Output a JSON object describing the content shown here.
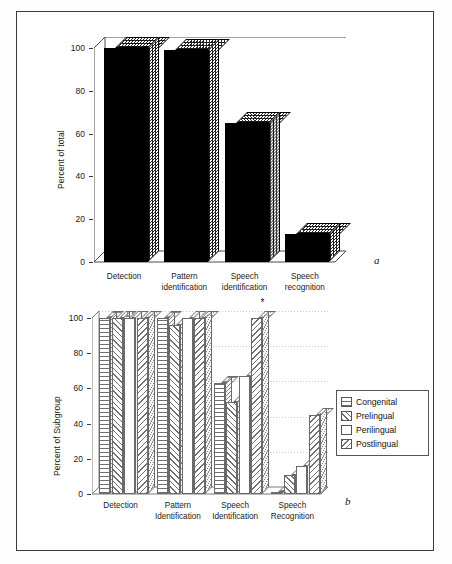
{
  "figure": {
    "panel_a_label": "a",
    "panel_b_label": "b",
    "significance_marker": "*"
  },
  "chart_data": [
    {
      "type": "bar",
      "panel": "a",
      "title": "",
      "xlabel": "",
      "ylabel": "Percent of total",
      "ylim": [
        0,
        100
      ],
      "yticks": [
        0,
        20,
        40,
        60,
        80,
        100
      ],
      "ytick_labels": [
        "0",
        "20",
        "40",
        "60",
        "80",
        "100"
      ],
      "grid": false,
      "legend": "none",
      "style": "3d-solid-black",
      "categories": [
        "Detection",
        "Pattern identification",
        "Speech identification",
        "Speech recognition"
      ],
      "category_lines": [
        [
          "Detection"
        ],
        [
          "Pattern",
          "identification"
        ],
        [
          "Speech",
          "identification"
        ],
        [
          "Speech",
          "recognition"
        ]
      ],
      "values": [
        100,
        99,
        65,
        13
      ]
    },
    {
      "type": "bar",
      "panel": "b",
      "title": "",
      "xlabel": "",
      "ylabel": "Percent of Subgroup",
      "ylim": [
        0,
        100
      ],
      "yticks": [
        0,
        20,
        40,
        60,
        80,
        100
      ],
      "ytick_labels": [
        "0",
        "20",
        "40",
        "60",
        "80",
        "100"
      ],
      "grid": true,
      "legend": "right",
      "style": "3d-hatched-grouped",
      "categories": [
        "Detection",
        "Pattern Identification",
        "Speech Identification",
        "Speech Recognition"
      ],
      "category_lines": [
        [
          "Detection"
        ],
        [
          "Pattern",
          "Identification"
        ],
        [
          "Speech",
          "Identification"
        ],
        [
          "Speech",
          "Recognition"
        ]
      ],
      "series": [
        {
          "name": "Congenital",
          "pattern": "horizontal-lines",
          "values": [
            100,
            100,
            63,
            1
          ]
        },
        {
          "name": "Prelingual",
          "pattern": "diagonal-forward",
          "values": [
            100,
            96,
            52,
            11
          ]
        },
        {
          "name": "Perilingual",
          "pattern": "blank",
          "values": [
            100,
            100,
            67,
            16
          ]
        },
        {
          "name": "Postlingual",
          "pattern": "diagonal-back",
          "values": [
            100,
            100,
            100,
            45
          ]
        }
      ],
      "annotations": [
        {
          "text": "*",
          "series": "Postlingual",
          "category": "Speech Identification"
        }
      ]
    }
  ],
  "legend": {
    "items": [
      {
        "label": "Congenital",
        "swatch": "horizontal-lines-swatch"
      },
      {
        "label": "Prelingual",
        "swatch": "diagonal-forward-swatch"
      },
      {
        "label": "Perilingual",
        "swatch": "blank-swatch"
      },
      {
        "label": "Postlingual",
        "swatch": "diagonal-back-swatch"
      }
    ]
  },
  "colors": {
    "bar_fill_a": "#000000",
    "bar_outline_b": "#6a6a6a",
    "frame": "#3a3a3a",
    "grid": "#c9c9c9",
    "background": "#ffffff"
  }
}
